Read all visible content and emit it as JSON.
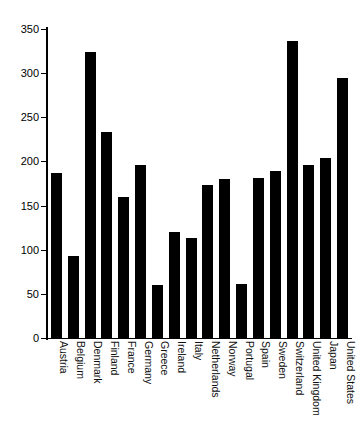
{
  "chart_data": {
    "type": "bar",
    "title": "",
    "xlabel": "",
    "ylabel": "",
    "ylim": [
      0,
      350
    ],
    "yticks": [
      0,
      50,
      100,
      150,
      200,
      250,
      300,
      350
    ],
    "grid": false,
    "legend": null,
    "bar_color": "#000000",
    "categories": [
      "Austria",
      "Belgium",
      "Denmark",
      "Finland",
      "France",
      "Germany",
      "Greece",
      "Ireland",
      "Italy",
      "Netherlands",
      "Norway",
      "Portugal",
      "Spain",
      "Sweden",
      "Switzerland",
      "United Kingdom",
      "Japan",
      "United States"
    ],
    "values": [
      187,
      93,
      324,
      233,
      160,
      196,
      60,
      120,
      113,
      173,
      180,
      61,
      181,
      189,
      336,
      196,
      204,
      294
    ]
  }
}
